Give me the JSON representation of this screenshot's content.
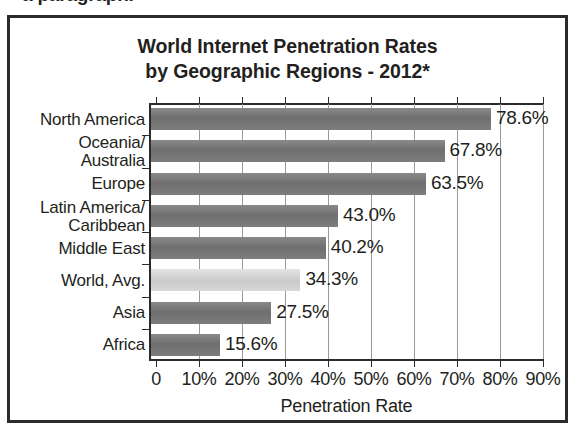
{
  "cropped_caption": "a paragraph.",
  "figure": {
    "title_line1": "World Internet Penetration Rates",
    "title_line2": "by Geographic Regions - 2012*"
  },
  "chart_data": {
    "type": "bar",
    "orientation": "horizontal",
    "title": "World Internet Penetration Rates by Geographic Regions - 2012*",
    "xlabel": "Penetration Rate",
    "ylabel": "",
    "xlim": [
      0,
      90
    ],
    "grid": true,
    "legend": false,
    "categories": [
      "North America",
      "Oceania/\nAustralia",
      "Europe",
      "Latin America/\nCaribbean",
      "Middle East",
      "World, Avg.",
      "Asia",
      "Africa"
    ],
    "values": [
      78.6,
      67.8,
      63.5,
      43.0,
      40.2,
      34.3,
      27.5,
      15.6
    ],
    "value_labels": [
      "78.6%",
      "67.8%",
      "63.5%",
      "43.0%",
      "40.2%",
      "34.3%",
      "27.5%",
      "15.6%"
    ],
    "xticks": [
      0,
      10,
      20,
      30,
      40,
      50,
      60,
      70,
      80,
      90
    ],
    "xtick_labels": [
      "0",
      "10%",
      "20%",
      "30%",
      "40%",
      "50%",
      "60%",
      "70%",
      "80%",
      "90%"
    ],
    "bar_color": "#767676",
    "highlight_color": "#d2d2d2",
    "highlight_category": "World, Avg."
  },
  "categories_display": [
    {
      "line1": "North America",
      "line2": ""
    },
    {
      "line1": "Oceania/",
      "line2": "Australia"
    },
    {
      "line1": "Europe",
      "line2": ""
    },
    {
      "line1": "Latin America/",
      "line2": "Caribbean"
    },
    {
      "line1": "Middle East",
      "line2": ""
    },
    {
      "line1": "World, Avg.",
      "line2": ""
    },
    {
      "line1": "Asia",
      "line2": ""
    },
    {
      "line1": "Africa",
      "line2": ""
    }
  ]
}
